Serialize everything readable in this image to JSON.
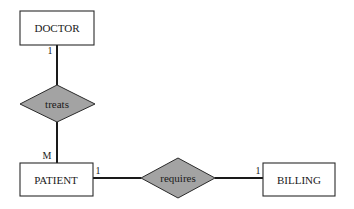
{
  "diagram": {
    "type": "entity-relationship",
    "colors": {
      "entity_fill": "#ffffff",
      "relationship_fill": "#a3a3a3",
      "stroke": "#2a2a2a"
    },
    "entities": [
      {
        "id": "doctor",
        "label": "DOCTOR"
      },
      {
        "id": "patient",
        "label": "PATIENT"
      },
      {
        "id": "billing",
        "label": "BILLING"
      }
    ],
    "relationships": [
      {
        "id": "treats",
        "label": "treats",
        "from": "doctor",
        "to": "patient",
        "from_cardinality": "1",
        "to_cardinality": "M"
      },
      {
        "id": "requires",
        "label": "requires",
        "from": "patient",
        "to": "billing",
        "from_cardinality": "1",
        "to_cardinality": "1"
      }
    ]
  }
}
